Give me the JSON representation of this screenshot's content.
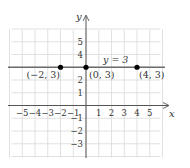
{
  "chart_data": {
    "type": "line",
    "title": "",
    "xlabel": "x",
    "ylabel": "y",
    "xlim": [
      -6,
      6
    ],
    "ylim": [
      -4,
      6
    ],
    "grid": true,
    "x_ticks": [
      "-5",
      "-4",
      "-3",
      "-2",
      "-1",
      "1",
      "2",
      "3",
      "4",
      "5"
    ],
    "y_ticks": [
      "5",
      "4",
      "2",
      "1",
      "-1",
      "-2",
      "-3"
    ],
    "series": [
      {
        "name": "y = 3",
        "type": "horizontal-line",
        "equation": "y = 3",
        "y": 3
      }
    ],
    "points": [
      {
        "x": -2,
        "y": 3,
        "label": "(−2, 3)"
      },
      {
        "x": 0,
        "y": 3,
        "label": "(0, 3)"
      },
      {
        "x": 4,
        "y": 3,
        "label": "(4, 3)"
      }
    ],
    "colors": {
      "grid": "#d9d9d9",
      "axis": "#555555",
      "line": "#6b6b6b",
      "point": "#000000"
    }
  }
}
